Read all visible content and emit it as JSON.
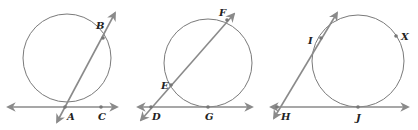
{
  "diagram": {
    "type": "geometry-circles-tangents-secants",
    "colors": {
      "stroke": "#8a8a8a",
      "circle": "#7a7a7a",
      "label": "#222222",
      "background": "#ffffff"
    },
    "panels": [
      {
        "id": "panel-1",
        "circle": {
          "cx": 67,
          "cy": 58,
          "r": 44
        },
        "lines": [
          {
            "name": "tangent-line-AC",
            "x1": 8,
            "y1": 107,
            "x2": 117,
            "y2": 107,
            "arrows": "both"
          },
          {
            "name": "secant-line-AB",
            "x1": 57,
            "y1": 122,
            "x2": 115,
            "y2": 13,
            "arrows": "both"
          }
        ],
        "points": [
          {
            "label": "B",
            "x": 103,
            "y": 38,
            "lx": 96,
            "ly": 29
          },
          {
            "label": "A",
            "x": 65,
            "y": 107,
            "lx": 67,
            "ly": 120
          },
          {
            "label": "C",
            "x": 101,
            "y": 107,
            "lx": 98,
            "ly": 120
          }
        ]
      },
      {
        "id": "panel-2",
        "circle": {
          "cx": 208,
          "cy": 63,
          "r": 44
        },
        "lines": [
          {
            "name": "tangent-line-DG",
            "x1": 138,
            "y1": 107,
            "x2": 252,
            "y2": 107,
            "arrows": "both"
          },
          {
            "name": "secant-line-DF",
            "x1": 141,
            "y1": 120,
            "x2": 234,
            "y2": 14,
            "arrows": "both"
          }
        ],
        "points": [
          {
            "label": "F",
            "x": 227,
            "y": 20,
            "lx": 219,
            "ly": 16
          },
          {
            "label": "E",
            "x": 171,
            "y": 85,
            "lx": 161,
            "ly": 89
          },
          {
            "label": "D",
            "x": 151,
            "y": 107,
            "lx": 152,
            "ly": 120
          },
          {
            "label": "G",
            "x": 208,
            "y": 107,
            "lx": 205,
            "ly": 120
          }
        ]
      },
      {
        "id": "panel-3",
        "circle": {
          "cx": 358,
          "cy": 61,
          "r": 46
        },
        "lines": [
          {
            "name": "tangent-line-HJ",
            "x1": 271,
            "y1": 107,
            "x2": 408,
            "y2": 107,
            "arrows": "both"
          },
          {
            "name": "tangent-line-HI",
            "x1": 274,
            "y1": 118,
            "x2": 337,
            "y2": 13,
            "arrows": "both"
          }
        ],
        "points": [
          {
            "label": "I",
            "x": 321,
            "y": 38,
            "lx": 308,
            "ly": 44
          },
          {
            "label": "X",
            "x": 396,
            "y": 36,
            "lx": 401,
            "ly": 40
          },
          {
            "label": "H",
            "x": 277,
            "y": 107,
            "lx": 281,
            "ly": 120
          },
          {
            "label": "J",
            "x": 358,
            "y": 107,
            "lx": 356,
            "ly": 121
          }
        ]
      }
    ]
  }
}
